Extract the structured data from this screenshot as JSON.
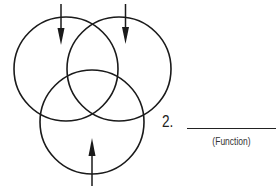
{
  "diagram": {
    "type": "venn",
    "circles": [
      {
        "id": "left",
        "cx": 66,
        "cy": 69,
        "r": 52
      },
      {
        "id": "right",
        "cx": 119,
        "cy": 69,
        "r": 52
      },
      {
        "id": "bottom",
        "cx": 92,
        "cy": 122,
        "r": 52
      }
    ],
    "arrows": [
      {
        "id": "top-left",
        "direction": "down"
      },
      {
        "id": "top-right",
        "direction": "down"
      },
      {
        "id": "bottom",
        "direction": "up"
      }
    ],
    "stroke_color": "#1a1a1a"
  },
  "label": {
    "number": "2.",
    "caption": "(Function)"
  }
}
